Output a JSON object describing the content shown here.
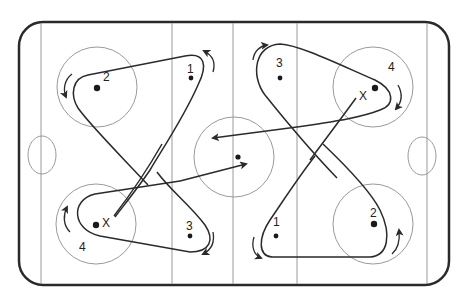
{
  "diagram": {
    "type": "hockey-rink-drill",
    "colors": {
      "boards": "#2a2a2a",
      "markings": "#9a9a9a",
      "paths": "#2a2a2a",
      "players": "#1a1a1a"
    },
    "players": [
      {
        "id": "top-left-2",
        "label": "2",
        "x": 97,
        "y": 88
      },
      {
        "id": "top-left-1",
        "label": "1",
        "x": 191,
        "y": 78
      },
      {
        "id": "top-right-3",
        "label": "3",
        "x": 280,
        "y": 78
      },
      {
        "id": "top-right-4",
        "label": "4",
        "x": 375,
        "y": 88
      },
      {
        "id": "bottom-left-4",
        "label": "4",
        "x": 96,
        "y": 225
      },
      {
        "id": "bottom-left-3",
        "label": "3",
        "x": 190,
        "y": 236
      },
      {
        "id": "bottom-right-1",
        "label": "1",
        "x": 276,
        "y": 236
      },
      {
        "id": "bottom-right-2",
        "label": "2",
        "x": 374,
        "y": 224
      },
      {
        "id": "center",
        "label": "",
        "x": 238,
        "y": 157
      }
    ],
    "labels": {
      "tl2": "2",
      "tl1": "1",
      "tr3": "3",
      "tr4": "4",
      "bl4": "4",
      "bl3": "3",
      "br1": "1",
      "br2": "2",
      "x_top": "X",
      "x_bottom": "X"
    }
  }
}
